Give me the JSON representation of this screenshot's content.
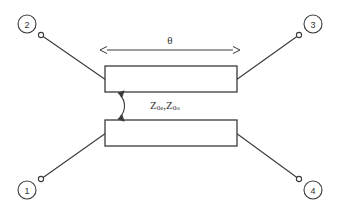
{
  "figure": {
    "stroke_color": "#3a3a3a",
    "text_color": "#333333",
    "background_color": "#ffffff"
  },
  "ports": [
    {
      "id": "port-1",
      "number": "1",
      "position": "bottom-left",
      "cx": 27,
      "cy": 190,
      "term_x": 41,
      "term_y": 179
    },
    {
      "id": "port-2",
      "number": "2",
      "position": "top-left",
      "cx": 27,
      "cy": 24,
      "term_x": 41,
      "term_y": 35
    },
    {
      "id": "port-3",
      "number": "3",
      "position": "top-right",
      "cx": 313,
      "cy": 24,
      "term_x": 299,
      "term_y": 35
    },
    {
      "id": "port-4",
      "number": "4",
      "position": "bottom-right",
      "cx": 313,
      "cy": 190,
      "term_x": 299,
      "term_y": 179
    }
  ],
  "lines": [
    {
      "id": "line-top",
      "label": "upper coupled line",
      "x": 105,
      "y": 66,
      "width": 132,
      "height": 26
    },
    {
      "id": "line-bottom",
      "label": "lower coupled line",
      "x": 105,
      "y": 120,
      "width": 132,
      "height": 26
    }
  ],
  "annotations": {
    "electrical_length": {
      "symbol": "θ",
      "description": "electrical length of the coupled section",
      "arrow_x1": 106,
      "arrow_x2": 234,
      "arrow_y": 50,
      "label_x": 170,
      "label_y": 41
    },
    "impedance": {
      "base": "Z",
      "even_subscript": "0e",
      "odd_subscript": "0o",
      "separator": ",",
      "full_text": "Z0e , Z0o",
      "description": "even-mode and odd-mode characteristic impedances",
      "label_x": 150,
      "label_y": 105
    },
    "coupling_arrow": {
      "description": "double-headed curved arrow spanning the coupling gap",
      "x_top": 120,
      "y_top": 93,
      "x_bottom": 120,
      "y_bottom": 119
    }
  },
  "connections": [
    {
      "id": "conn-2",
      "from_port": "2",
      "to_line": "line-top",
      "x1": 41,
      "y1": 35,
      "x2": 106,
      "y2": 80
    },
    {
      "id": "conn-3",
      "from_port": "3",
      "to_line": "line-top",
      "x1": 299,
      "y1": 35,
      "x2": 236,
      "y2": 80
    },
    {
      "id": "conn-1",
      "from_port": "1",
      "to_line": "line-bottom",
      "x1": 41,
      "y1": 179,
      "x2": 106,
      "y2": 133
    },
    {
      "id": "conn-4",
      "from_port": "4",
      "to_line": "line-bottom",
      "x1": 299,
      "y1": 179,
      "x2": 236,
      "y2": 133
    }
  ]
}
